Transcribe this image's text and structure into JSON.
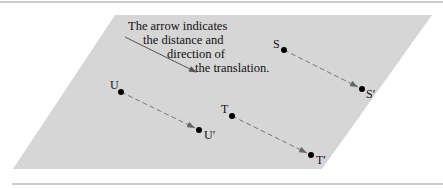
{
  "figure": {
    "background_color": "#ffffff",
    "plane_color": "#d6d6d6",
    "rule_color": "#bdbdbd",
    "plane": {
      "top_left": [
        115,
        15
      ],
      "top_right": [
        432,
        15
      ],
      "bottom_right": [
        322,
        169
      ],
      "bottom_left": [
        13,
        169
      ]
    },
    "caption": {
      "lines": [
        "The arrow indicates",
        "the distance and",
        "direction of",
        "the translation."
      ]
    },
    "indicator_arrow": {
      "from": [
        125,
        37
      ],
      "to": [
        196,
        72
      ]
    },
    "points": [
      {
        "label": "S",
        "image_label": "S′",
        "from": [
          284,
          50
        ],
        "to": [
          362,
          89
        ]
      },
      {
        "label": "U",
        "image_label": "U′",
        "from": [
          121,
          92
        ],
        "to": [
          199,
          130
        ]
      },
      {
        "label": "T",
        "image_label": "T′",
        "from": [
          232,
          116
        ],
        "to": [
          311,
          155
        ]
      }
    ]
  }
}
